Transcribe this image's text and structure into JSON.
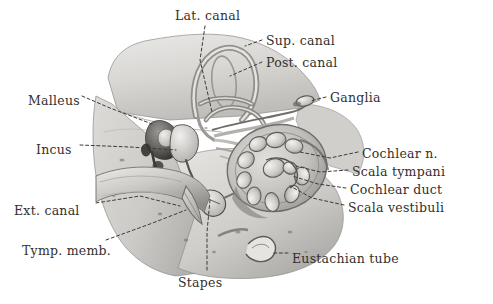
{
  "figure": {
    "type": "anatomical-illustration",
    "medium": "grayscale pencil / wash drawing",
    "background_color": "#ffffff",
    "ink_color": "#33302e",
    "leader_line_style": "dashed"
  },
  "labels": [
    {
      "id": "lat-canal",
      "text": "Lat. canal",
      "x": 175,
      "y": 10,
      "anchor": "start"
    },
    {
      "id": "sup-canal",
      "text": "Sup. canal",
      "x": 266,
      "y": 35,
      "anchor": "start"
    },
    {
      "id": "post-canal",
      "text": "Post. canal",
      "x": 266,
      "y": 57,
      "anchor": "start"
    },
    {
      "id": "ganglia",
      "text": "Ganglia",
      "x": 330,
      "y": 92,
      "anchor": "start"
    },
    {
      "id": "malleus",
      "text": "Malleus",
      "x": 28,
      "y": 95,
      "anchor": "start"
    },
    {
      "id": "incus",
      "text": "Incus",
      "x": 36,
      "y": 144,
      "anchor": "start"
    },
    {
      "id": "cochlear-n",
      "text": "Cochlear n.",
      "x": 362,
      "y": 148,
      "anchor": "start"
    },
    {
      "id": "scala-tympani",
      "text": "Scala tympani",
      "x": 352,
      "y": 166,
      "anchor": "start"
    },
    {
      "id": "cochlear-duct",
      "text": "Cochlear duct",
      "x": 350,
      "y": 184,
      "anchor": "start"
    },
    {
      "id": "scala-vestibuli",
      "text": "Scala vestibuli",
      "x": 348,
      "y": 202,
      "anchor": "start"
    },
    {
      "id": "ext-canal",
      "text": "Ext. canal",
      "x": 14,
      "y": 205,
      "anchor": "start"
    },
    {
      "id": "tymp-memb",
      "text": "Tymp. memb.",
      "x": 22,
      "y": 245,
      "anchor": "start"
    },
    {
      "id": "stapes",
      "text": "Stapes",
      "x": 178,
      "y": 277,
      "anchor": "start"
    },
    {
      "id": "eustachian-tube",
      "text": "Eustachian tube",
      "x": 292,
      "y": 253,
      "anchor": "start"
    }
  ],
  "leaders": [
    {
      "id": "lat-canal-leader",
      "points": "205,26 200,60 212,112"
    },
    {
      "id": "sup-canal-leader",
      "points": "262,40 245,46"
    },
    {
      "id": "post-canal-leader",
      "points": "262,62 230,76"
    },
    {
      "id": "ganglia-leader",
      "points": "326,97 310,101"
    },
    {
      "id": "malleus-leader",
      "points": "82,96 110,108 152,124"
    },
    {
      "id": "incus-leader",
      "points": "80,145 130,147 176,150"
    },
    {
      "id": "cochlear-n-leader",
      "points": "358,152 330,158 300,152"
    },
    {
      "id": "scala-tympani-leader",
      "points": "348,170 320,172 296,166"
    },
    {
      "id": "cochlear-duct-leader",
      "points": "346,188 318,184 292,176"
    },
    {
      "id": "scala-vestibuli-leader",
      "points": "344,205 312,198 290,186"
    },
    {
      "id": "ext-canal-leader",
      "points": "96,203 140,196 180,206"
    },
    {
      "id": "tymp-memb-leader",
      "points": "106,240 150,224 186,210"
    },
    {
      "id": "stapes-leader",
      "points": "207,270 207,232 210,200"
    },
    {
      "id": "eustachian-leader",
      "points": "288,253 272,253"
    }
  ],
  "structures": [
    {
      "id": "temporal-bone-mass",
      "name": "temporal bone block"
    },
    {
      "id": "superior-canal-loop",
      "name": "superior semicircular canal"
    },
    {
      "id": "lateral-canal",
      "name": "lateral semicircular canal"
    },
    {
      "id": "posterior-canal",
      "name": "posterior semicircular canal"
    },
    {
      "id": "malleus-ossicle",
      "name": "malleus"
    },
    {
      "id": "incus-ossicle",
      "name": "incus"
    },
    {
      "id": "stapes-ossicle",
      "name": "stapes"
    },
    {
      "id": "cochlea-spiral",
      "name": "cochlea, sectioned spiral"
    },
    {
      "id": "cochlear-nerve-bundle",
      "name": "cochlear nerve fibres"
    },
    {
      "id": "ganglia-body",
      "name": "spiral ganglia"
    },
    {
      "id": "external-auditory-canal",
      "name": "external auditory canal"
    },
    {
      "id": "tympanic-membrane",
      "name": "tympanic membrane"
    },
    {
      "id": "eustachian-opening",
      "name": "eustachian tube opening"
    }
  ]
}
